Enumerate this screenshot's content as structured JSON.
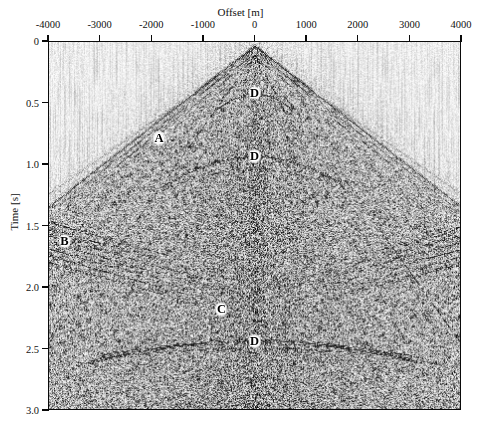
{
  "figure": {
    "type": "seismic-shot-gather",
    "background": "#ffffff",
    "ink": "#0a0a0a"
  },
  "axes": {
    "x": {
      "label": "Offset [m]",
      "min": -4000,
      "max": 4000,
      "ticks": [
        -4000,
        -3000,
        -2000,
        -1000,
        0,
        1000,
        2000,
        3000,
        4000
      ],
      "tick_labels": [
        "-4000",
        "-3000",
        "-2000",
        "-1000",
        "0",
        "1000",
        "2000",
        "3000",
        "4000"
      ]
    },
    "y": {
      "label": "Time [s]",
      "min": 0,
      "max": 3.0,
      "inverted": true,
      "ticks": [
        0,
        0.5,
        1.0,
        1.5,
        2.0,
        2.5,
        3.0
      ],
      "tick_labels": [
        "0",
        "0.5",
        "1.0",
        "1.5",
        "2.0",
        "2.5",
        "3.0"
      ]
    }
  },
  "annotations": [
    {
      "label": "A",
      "offset_m": -1850,
      "time_s": 0.79
    },
    {
      "label": "B",
      "offset_m": -3680,
      "time_s": 1.63
    },
    {
      "label": "C",
      "offset_m": -640,
      "time_s": 2.18
    },
    {
      "label": "D",
      "offset_m": 0,
      "time_s": 0.42
    },
    {
      "label": "D",
      "offset_m": 0,
      "time_s": 0.935
    },
    {
      "label": "D",
      "offset_m": 0,
      "time_s": 2.44
    }
  ],
  "chart_data": {
    "type": "heatmap",
    "title": "",
    "xlabel": "Offset [m]",
    "ylabel": "Time [s]",
    "xlim": [
      -4000,
      4000
    ],
    "ylim": [
      0,
      3.0
    ],
    "y_inverted": true,
    "grid": false,
    "legend": null,
    "colormap": "grayscale",
    "events": [
      {
        "name": "A",
        "kind": "refraction-first-break-cone",
        "apex_offset_m": 0,
        "apex_time_s": 0.03,
        "apparent_velocity_mps": 3050,
        "note": "Strong linear first-arrival cone radiating from zero offset; label A sits on the left limb."
      },
      {
        "name": "B",
        "kind": "dipping-reflector-package",
        "offset_m": -3680,
        "time_s": 1.63,
        "note": "Coherent steep dipping events at far negative offset."
      },
      {
        "name": "C",
        "kind": "noise-cone",
        "offset_m": -640,
        "time_s": 2.18,
        "note": "Incoherent scattered energy / ground-roll cone in the near-offset interior."
      },
      {
        "name": "D1",
        "kind": "flat-reflector",
        "time_s": 0.42,
        "offset_range_m": [
          -700,
          700
        ],
        "note": "Shallow near-offset reflection marked D."
      },
      {
        "name": "D2",
        "kind": "flat-reflector",
        "time_s": 0.935,
        "offset_range_m": [
          -1400,
          1400
        ],
        "note": "Mid reflector marked D."
      },
      {
        "name": "D3",
        "kind": "flat-reflector",
        "time_s": 2.44,
        "offset_range_m": [
          -2600,
          2600
        ],
        "note": "Deep sub-horizontal reflector marked D."
      }
    ],
    "series": [
      {
        "name": "first-break cone (left limb)",
        "x": [
          -4000,
          0
        ],
        "y": [
          1.33,
          0.03
        ]
      },
      {
        "name": "first-break cone (right limb)",
        "x": [
          0,
          4000
        ],
        "y": [
          0.03,
          1.33
        ]
      },
      {
        "name": "reflector D1",
        "x": [
          -700,
          700
        ],
        "y": [
          0.42,
          0.42
        ]
      },
      {
        "name": "reflector D2",
        "x": [
          -1400,
          1400
        ],
        "y": [
          0.935,
          0.935
        ]
      },
      {
        "name": "reflector D3",
        "x": [
          -2600,
          2600
        ],
        "y": [
          2.44,
          2.44
        ]
      }
    ]
  }
}
